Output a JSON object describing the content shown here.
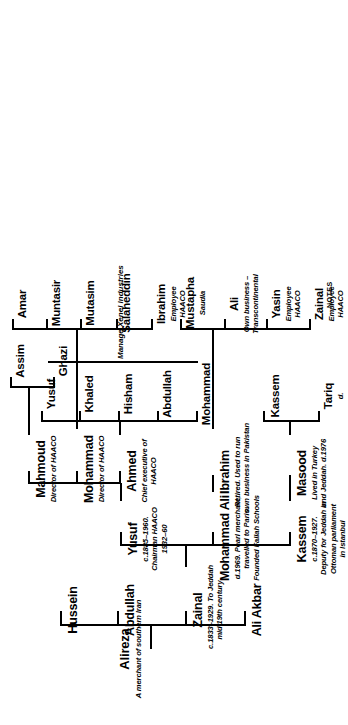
{
  "diagram": {
    "footnote": "NOTES",
    "span_note": "Manage Xenel Industries",
    "generations": [
      {
        "id": "g1",
        "people": [
          {
            "name": "Alireza",
            "desc": [
              "A merchant of southern Iran"
            ]
          }
        ]
      },
      {
        "id": "g2",
        "people": [
          {
            "name": "Ali Akbar",
            "desc": []
          },
          {
            "name": "Zainal",
            "desc": [
              "c.1833–1929. To Jeddah",
              "mid 19th century"
            ]
          },
          {
            "name": "Abdullah",
            "desc": []
          },
          {
            "name": "Hussein",
            "desc": []
          }
        ]
      },
      {
        "id": "g3",
        "people": [
          {
            "name": "Kassem",
            "desc": [
              "c.1870–1927.",
              "Deputy for Jeddah in",
              "Ottoman parliament",
              "in Istanbul"
            ]
          },
          {
            "name": "Mohammad Ali",
            "desc": [
              "d.1969. Pearl merchant,",
              "travelled to Paris.",
              "Founded Fallah Schools"
            ]
          },
          {
            "name": "Yusuf",
            "desc": [
              "c.1885–1960.",
              "Chairman HAACO",
              "1932–60"
            ]
          }
        ]
      },
      {
        "id": "g4",
        "people": [
          {
            "name": "Masood",
            "desc": [
              "Lived in Turkey",
              "and Jeddah. d.1976"
            ]
          },
          {
            "name": "Ibrahim",
            "desc": [
              "Retired. Used to run",
              "own business in Pakistan"
            ]
          },
          {
            "name": "Ahmed",
            "desc": [
              "Chief executive of",
              "HAACO"
            ]
          },
          {
            "name": "Mohammad",
            "desc": [
              "Director of HAACO"
            ]
          },
          {
            "name": "Mahmoud",
            "desc": [
              "Director of HAACO"
            ]
          }
        ]
      },
      {
        "id": "g5",
        "people": [
          {
            "name": "Tariq",
            "desc": [
              "d."
            ]
          },
          {
            "name": "Kassem",
            "desc": []
          },
          {
            "name": "Mohammad",
            "desc": []
          },
          {
            "name": "Abdullah",
            "desc": []
          },
          {
            "name": "Hisham",
            "desc": []
          },
          {
            "name": "Khaled",
            "desc": []
          },
          {
            "name": "Yusuf",
            "desc": []
          },
          {
            "name": "Ghazi",
            "desc": []
          },
          {
            "name": "Assim",
            "desc": []
          }
        ]
      },
      {
        "id": "g6",
        "people": [
          {
            "name": "Zainal",
            "desc": [
              "Employee",
              "HAACO"
            ]
          },
          {
            "name": "Yasin",
            "desc": [
              "Employee",
              "HAACO"
            ]
          },
          {
            "name": "Ali",
            "desc": [
              "Own business –",
              "Transcontinental"
            ]
          },
          {
            "name": "Mustapha",
            "desc": [
              "Saudia"
            ]
          },
          {
            "name": "Ibrahim",
            "desc": [
              "Employee",
              "HAACO"
            ]
          },
          {
            "name": "Salaheddin",
            "desc": []
          },
          {
            "name": "Mutasim",
            "desc": []
          },
          {
            "name": "Muntasir",
            "desc": []
          },
          {
            "name": "Amar",
            "desc": []
          }
        ]
      }
    ]
  }
}
